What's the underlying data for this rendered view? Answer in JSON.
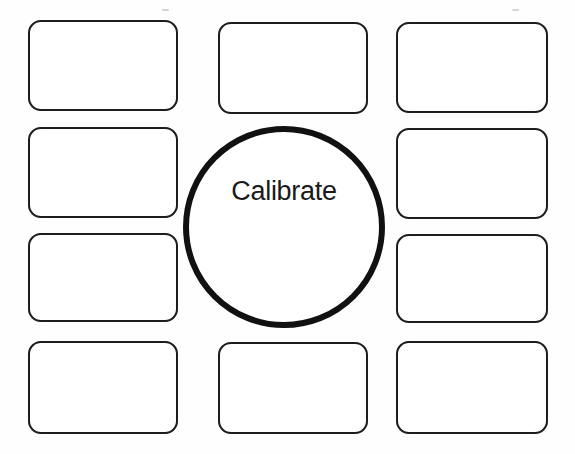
{
  "page": {
    "background_color": "#fefefe",
    "ink_color": "#1b1b1b",
    "width": 575,
    "height": 454
  },
  "center": {
    "name": "center-oval",
    "label": "Calibrate",
    "shape": "oval",
    "stroke_color": "#111111",
    "stroke_width": 6,
    "x": 183,
    "y": 126,
    "width": 202,
    "height": 202,
    "label_font_size": 27,
    "label_top_offset": 46
  },
  "boxes": [
    {
      "id": "box-left-1",
      "label": "",
      "column": "left",
      "row": 1,
      "x": 28,
      "y": 20,
      "width": 150,
      "height": 91
    },
    {
      "id": "box-left-2",
      "label": "",
      "column": "left",
      "row": 2,
      "x": 28,
      "y": 127,
      "width": 150,
      "height": 91
    },
    {
      "id": "box-left-3",
      "label": "",
      "column": "left",
      "row": 3,
      "x": 28,
      "y": 233,
      "width": 150,
      "height": 89
    },
    {
      "id": "box-left-4",
      "label": "",
      "column": "left",
      "row": 4,
      "x": 28,
      "y": 341,
      "width": 150,
      "height": 93
    },
    {
      "id": "box-center-1",
      "label": "",
      "column": "center",
      "row": 1,
      "x": 218,
      "y": 22,
      "width": 150,
      "height": 92
    },
    {
      "id": "box-center-4",
      "label": "",
      "column": "center",
      "row": 4,
      "x": 218,
      "y": 342,
      "width": 150,
      "height": 92
    },
    {
      "id": "box-right-1",
      "label": "",
      "column": "right",
      "row": 1,
      "x": 396,
      "y": 22,
      "width": 152,
      "height": 91
    },
    {
      "id": "box-right-2",
      "label": "",
      "column": "right",
      "row": 2,
      "x": 396,
      "y": 128,
      "width": 152,
      "height": 91
    },
    {
      "id": "box-right-3",
      "label": "",
      "column": "right",
      "row": 3,
      "x": 396,
      "y": 234,
      "width": 152,
      "height": 89
    },
    {
      "id": "box-right-4",
      "label": "",
      "column": "right",
      "row": 4,
      "x": 396,
      "y": 341,
      "width": 152,
      "height": 93
    }
  ],
  "scan_marks": [
    {
      "x": 162,
      "y": 9,
      "width": 7
    },
    {
      "x": 512,
      "y": 9,
      "width": 7
    }
  ]
}
